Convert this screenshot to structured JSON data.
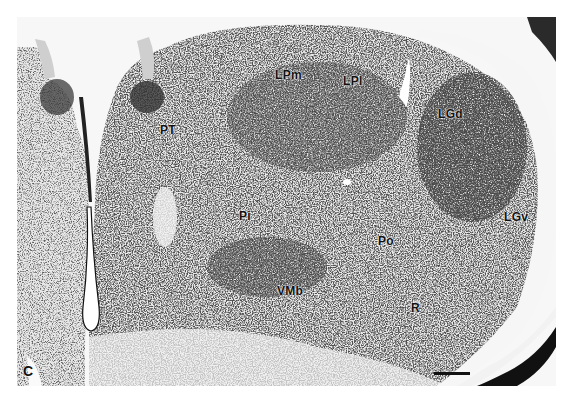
{
  "figure": {
    "panel_letter": "C",
    "stain_color": "#1a1a1a",
    "background_color": "#f7f7f7",
    "labels": [
      {
        "id": "LPm",
        "text": "LPm"
      },
      {
        "id": "LPl",
        "text": "LPl"
      },
      {
        "id": "LGd",
        "text": "LGd"
      },
      {
        "id": "PT",
        "text": "PT"
      },
      {
        "id": "Pi",
        "text": "Pi"
      },
      {
        "id": "LGv",
        "text": "LGv"
      },
      {
        "id": "Po",
        "text": "Po"
      },
      {
        "id": "VMb",
        "text": "VMb"
      },
      {
        "id": "R",
        "text": "R"
      }
    ],
    "scale_bar": {
      "label": ""
    }
  }
}
